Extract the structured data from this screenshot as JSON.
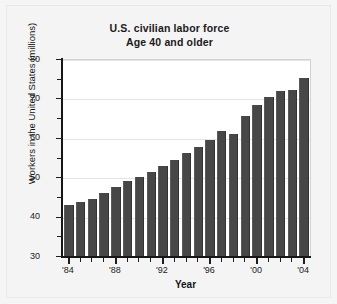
{
  "figure": {
    "background_color": "#f4f4f4",
    "plot_background_color": "#ffffff",
    "bar_color": "#474747",
    "gridline_color": "#e4e4e4",
    "axis_color": "#161616"
  },
  "chart_data": {
    "type": "bar",
    "title": "U.S. civilian labor force",
    "subtitle": "Age 40 and older",
    "title_lines": [
      "U.S. civilian labor force",
      "Age 40 and older"
    ],
    "xlabel": "Year",
    "ylabel": "Workers in the United States (millions)",
    "ylim": [
      30,
      80
    ],
    "ytick_labels": [
      "30",
      "40",
      "50",
      "60",
      "70",
      "80"
    ],
    "ytick_values": [
      30,
      40,
      50,
      60,
      70,
      80
    ],
    "yminor_values": [
      35,
      45,
      55,
      65,
      75
    ],
    "grid": "horizontal",
    "legend": "none",
    "xtick_labels": [
      "'84",
      "'88",
      "'92",
      "'96",
      "'00",
      "'04"
    ],
    "xtick_categories": [
      "1984",
      "1988",
      "1992",
      "1996",
      "2000",
      "2004"
    ],
    "categories": [
      "1984",
      "1985",
      "1986",
      "1987",
      "1988",
      "1989",
      "1990",
      "1991",
      "1992",
      "1993",
      "1994",
      "1995",
      "1996",
      "1997",
      "1998",
      "1999",
      "2000",
      "2001",
      "2002",
      "2003",
      "2004"
    ],
    "category_labels": [
      "'84",
      "'85",
      "'86",
      "'87",
      "'88",
      "'89",
      "'90",
      "'91",
      "'92",
      "'93",
      "'94",
      "'95",
      "'96",
      "'97",
      "'98",
      "'99",
      "'00",
      "'01",
      "'02",
      "'03",
      "'04"
    ],
    "values": [
      43.2,
      44.0,
      44.7,
      46.2,
      47.7,
      49.3,
      50.4,
      51.5,
      53.0,
      54.5,
      56.5,
      57.9,
      59.7,
      62.0,
      61.1,
      65.8,
      68.6,
      70.5,
      72.2,
      72.4,
      75.4
    ]
  }
}
